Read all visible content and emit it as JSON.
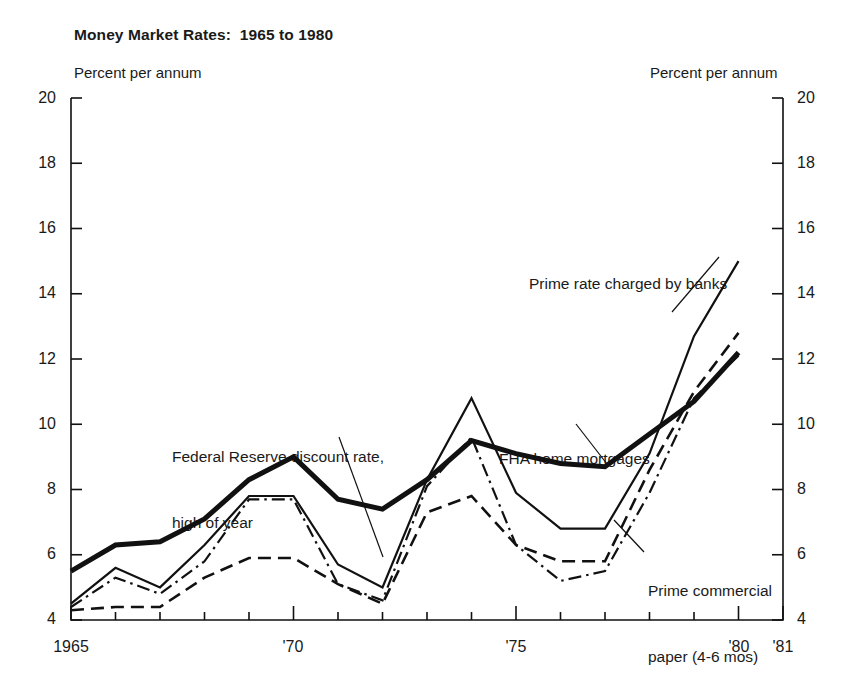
{
  "chart_data": {
    "type": "line",
    "title": "Money Market Rates:  1965 to 1980",
    "ylabel_left": "Percent per annum",
    "ylabel_right": "Percent per annum",
    "xlabel": "",
    "xlim": [
      1965,
      1981
    ],
    "ylim": [
      4,
      20
    ],
    "yticks": [
      4,
      6,
      8,
      10,
      12,
      14,
      16,
      18,
      20
    ],
    "ytick_labels": [
      "4",
      "6",
      "8",
      "10",
      "12",
      "14",
      "16",
      "18",
      "20"
    ],
    "xticks": [
      1965,
      1966,
      1967,
      1968,
      1969,
      1970,
      1971,
      1972,
      1973,
      1974,
      1975,
      1976,
      1977,
      1978,
      1979,
      1980,
      1981
    ],
    "xtick_labels": [
      {
        "x": 1965,
        "label": "1965"
      },
      {
        "x": 1970,
        "label": "'70"
      },
      {
        "x": 1975,
        "label": "'75"
      },
      {
        "x": 1980,
        "label": "'80"
      },
      {
        "x": 1981,
        "label": "'81"
      }
    ],
    "grid": false,
    "legend": "annotations",
    "x": [
      1965,
      1966,
      1967,
      1968,
      1969,
      1970,
      1971,
      1972,
      1973,
      1974,
      1975,
      1976,
      1977,
      1978,
      1979,
      1980
    ],
    "series": [
      {
        "name": "FHA home mortgages",
        "style": "thick-solid",
        "color": "#111111",
        "values": [
          5.5,
          6.3,
          6.4,
          7.1,
          8.3,
          9.0,
          7.7,
          7.4,
          8.3,
          9.5,
          9.1,
          8.8,
          8.7,
          9.7,
          10.7,
          12.2
        ]
      },
      {
        "name": "Prime rate charged by banks",
        "style": "thin-solid",
        "color": "#111111",
        "values": [
          4.5,
          5.6,
          5.0,
          6.3,
          7.8,
          7.8,
          5.7,
          5.0,
          8.3,
          10.8,
          7.9,
          6.8,
          6.8,
          9.1,
          12.7,
          15.0
        ]
      },
      {
        "name": "Prime commercial paper (4-6 mos)",
        "style": "dash-dot",
        "color": "#111111",
        "values": [
          4.4,
          5.3,
          4.8,
          5.8,
          7.7,
          7.7,
          5.1,
          4.6,
          8.1,
          9.6,
          6.3,
          5.2,
          5.5,
          7.9,
          10.8,
          12.1
        ]
      },
      {
        "name": "Federal Reserve discount rate, high of year",
        "style": "dashed",
        "color": "#111111",
        "values": [
          4.3,
          4.4,
          4.4,
          5.3,
          5.9,
          5.9,
          5.1,
          4.5,
          7.3,
          7.8,
          6.3,
          5.8,
          5.8,
          8.6,
          11.0,
          12.8
        ]
      }
    ],
    "annotations": [
      {
        "name": "federal-reserve-discount-rate",
        "lines": [
          "Federal Reserve discount rate,",
          "high of year"
        ]
      },
      {
        "name": "prime-rate-charged-by-banks",
        "lines": [
          "Prime rate charged by banks"
        ]
      },
      {
        "name": "fha-home-mortgages",
        "lines": [
          "FHA home mortgages"
        ]
      },
      {
        "name": "prime-commercial-paper",
        "lines": [
          "Prime commercial",
          "paper (4-6 mos)"
        ]
      }
    ]
  }
}
